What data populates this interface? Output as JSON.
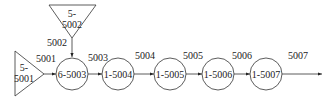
{
  "diagram": {
    "sources": [
      {
        "id": "src-5001",
        "line1": "5-",
        "line2": "5001",
        "shape": "triangle-right"
      },
      {
        "id": "src-5002",
        "line1": "5-",
        "line2": "5002",
        "shape": "triangle-down"
      }
    ],
    "nodes": [
      {
        "label": "6-5003"
      },
      {
        "label": "1-5004"
      },
      {
        "label": "1-5005"
      },
      {
        "label": "1-5006"
      },
      {
        "label": "1-5007"
      }
    ],
    "edges": [
      {
        "label": "5001"
      },
      {
        "label": "5002"
      },
      {
        "label": "5003"
      },
      {
        "label": "5004"
      },
      {
        "label": "5005"
      },
      {
        "label": "5006"
      },
      {
        "label": "5007"
      }
    ],
    "colors": {
      "stroke": "#333333",
      "background": "#ffffff"
    }
  }
}
